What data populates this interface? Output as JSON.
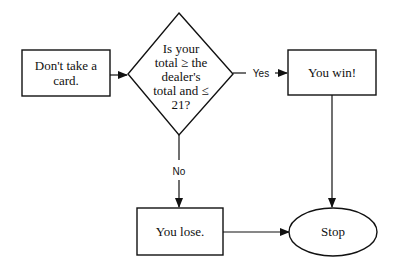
{
  "diagram": {
    "type": "flowchart",
    "nodes": [
      {
        "id": "dont_take",
        "shape": "rectangle",
        "lines": [
          "Don't take a",
          "card."
        ]
      },
      {
        "id": "decision",
        "shape": "diamond",
        "lines": [
          "Is your",
          "total ≥ the",
          "dealer's",
          "total and ≤",
          "21?"
        ]
      },
      {
        "id": "win",
        "shape": "rectangle",
        "lines": [
          "You win!"
        ]
      },
      {
        "id": "lose",
        "shape": "rectangle",
        "lines": [
          "You lose."
        ]
      },
      {
        "id": "stop",
        "shape": "ellipse",
        "lines": [
          "Stop"
        ]
      }
    ],
    "edges": [
      {
        "from": "dont_take",
        "to": "decision",
        "label": ""
      },
      {
        "from": "decision",
        "to": "win",
        "label": "Yes"
      },
      {
        "from": "decision",
        "to": "lose",
        "label": "No"
      },
      {
        "from": "win",
        "to": "stop",
        "label": ""
      },
      {
        "from": "lose",
        "to": "stop",
        "label": ""
      }
    ]
  }
}
